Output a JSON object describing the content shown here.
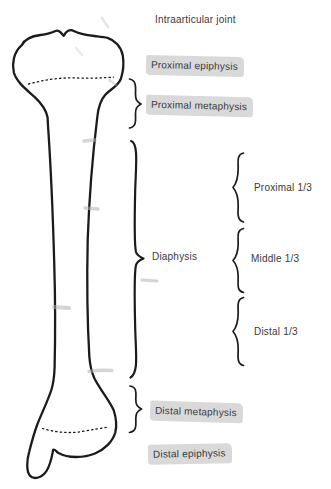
{
  "labels": {
    "intraarticular_joint": {
      "text": "Intraarticular joint",
      "highlighted": false
    },
    "proximal_epiphysis": {
      "text": "Proximal epiphysis",
      "highlighted": true
    },
    "proximal_metaphysis": {
      "text": "Proximal metaphysis",
      "highlighted": true
    },
    "diaphysis": {
      "text": "Diaphysis",
      "highlighted": false
    },
    "proximal_third": {
      "text": "Proximal 1/3",
      "highlighted": false
    },
    "middle_third": {
      "text": "Middle 1/3",
      "highlighted": false
    },
    "distal_third": {
      "text": "Distal 1/3",
      "highlighted": false
    },
    "distal_metaphysis": {
      "text": "Distal metaphysis",
      "highlighted": true
    },
    "distal_epiphysis": {
      "text": "Distal epiphysis",
      "highlighted": true
    }
  },
  "colors": {
    "background": "#ffffff",
    "outline": "#1b1b1b",
    "text": "#3a3a3a",
    "highlight": "#d9d9d9",
    "smudge": "#b4b4b4"
  }
}
